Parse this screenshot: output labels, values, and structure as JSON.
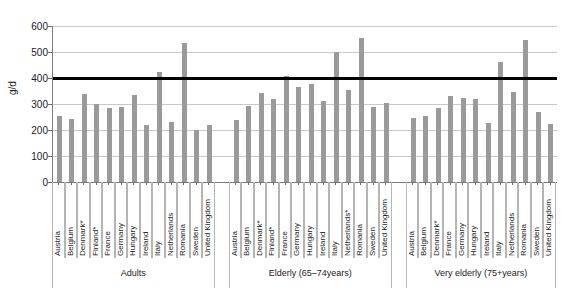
{
  "chart_data": {
    "type": "bar",
    "title": "",
    "xlabel": "",
    "ylabel": "g/d",
    "ylim": [
      0,
      600
    ],
    "ytick_step": 100,
    "yticks": [
      "600",
      "500",
      "400",
      "300",
      "200",
      "100",
      "0"
    ],
    "grid": true,
    "legend": "none",
    "bar_color": "#9a9a9a",
    "reference_line": {
      "value": 400,
      "color": "#000000",
      "label": ""
    },
    "groups": [
      {
        "label": "Adults",
        "categories": [
          "Austria",
          "Belgium",
          "Denmark*",
          "Finland*",
          "France",
          "Germany",
          "Hungary",
          "Ireland",
          "Italy",
          "Netherlands",
          "Romania",
          "Sweden",
          "United Kingdom"
        ],
        "values": [
          252,
          241,
          339,
          299,
          284,
          289,
          335,
          219,
          425,
          231,
          535,
          200,
          221
        ]
      },
      {
        "label": "Elderly (65–74years)",
        "categories": [
          "Austria",
          "Belgium",
          "Denmark*",
          "Finland*",
          "France",
          "Germany",
          "Hungary",
          "Ireland",
          "Italy",
          "Netherlands*",
          "Romania",
          "Sweden",
          "United Kingdom"
        ],
        "values": [
          237,
          294,
          343,
          320,
          407,
          365,
          378,
          310,
          500,
          355,
          555,
          288,
          305
        ]
      },
      {
        "label": "Very elderly (75+years)",
        "categories": [
          "Austria",
          "Belgium",
          "Denmark*",
          "France",
          "Germany",
          "Hungary",
          "Ireland",
          "Italy",
          "Netherlands",
          "Romania",
          "Sweden",
          "United Kingdom"
        ],
        "values": [
          245,
          253,
          283,
          330,
          325,
          320,
          227,
          462,
          348,
          545,
          268,
          225
        ]
      }
    ]
  }
}
